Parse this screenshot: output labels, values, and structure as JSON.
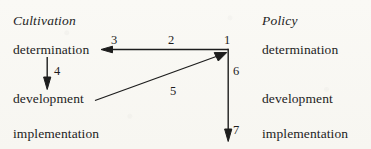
{
  "figure": {
    "type": "flow-diagram",
    "background_color": "#fbfaf7",
    "ink_color": "#1d1d1d",
    "columns": [
      {
        "id": "cultivation",
        "heading": "Cultivation",
        "heading_style": "italic",
        "stages": [
          "determination",
          "development",
          "implementation"
        ]
      },
      {
        "id": "policy",
        "heading": "Policy",
        "heading_style": "italic",
        "stages": [
          "determination",
          "development",
          "implementation"
        ]
      }
    ],
    "edge_labels": {
      "one": "1",
      "two": "2",
      "three": "3",
      "four": "4",
      "five": "5",
      "six": "6",
      "seven": "7"
    },
    "edges": [
      {
        "label": "1",
        "from": "policy.determination",
        "to": "policy.determination",
        "note": "top-right node anchor"
      },
      {
        "label": "2",
        "from": "policy.determination",
        "to": "cultivation.determination",
        "note": "horizontal leftward arrow"
      },
      {
        "label": "3",
        "from": "policy.determination",
        "to": "cultivation.determination",
        "note": "arrowhead at cultivation determination"
      },
      {
        "label": "4",
        "from": "cultivation.determination",
        "to": "cultivation.development",
        "note": "vertical downward arrow"
      },
      {
        "label": "5",
        "from": "cultivation.development",
        "to": "policy.determination",
        "note": "diagonal upward-right arrow"
      },
      {
        "label": "6",
        "from": "policy.determination",
        "to": "policy.implementation",
        "note": "vertical downward line"
      },
      {
        "label": "7",
        "from": "policy.determination",
        "to": "policy.implementation",
        "note": "arrowhead at policy implementation"
      }
    ]
  }
}
